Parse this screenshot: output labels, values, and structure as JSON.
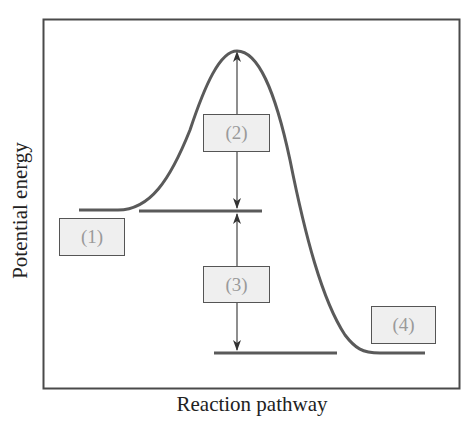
{
  "diagram": {
    "type": "energy-profile",
    "axes": {
      "xlabel": "Reaction pathway",
      "ylabel": "Potential energy"
    },
    "labels": [
      {
        "id": "1",
        "text": "(1)",
        "meaning": "reactant energy level"
      },
      {
        "id": "2",
        "text": "(2)",
        "meaning": "activation energy arrow"
      },
      {
        "id": "3",
        "text": "(3)",
        "meaning": "energy change arrow"
      },
      {
        "id": "4",
        "text": "(4)",
        "meaning": "product energy level"
      }
    ],
    "colors": {
      "curve": "#555555",
      "frame": "#444444",
      "label_fill": "#efefef",
      "label_text": "#9a9a9a"
    }
  }
}
